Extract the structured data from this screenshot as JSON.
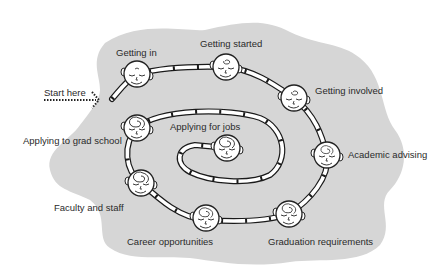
{
  "diagram": {
    "type": "spiral-path",
    "background_color": "#ffffff",
    "blob_color": "#d6d6d6",
    "track_color": "#ffffff",
    "track_outline": "#1a1a1a",
    "start": {
      "label": "Start here"
    },
    "stages": [
      {
        "id": "getting-in",
        "label": "Getting in",
        "head_style": "calm"
      },
      {
        "id": "getting-started",
        "label": "Getting started",
        "head_style": "slight-swirl"
      },
      {
        "id": "getting-involved",
        "label": "Getting involved",
        "head_style": "slight-swirl"
      },
      {
        "id": "academic-advising",
        "label": "Academic advising",
        "head_style": "swirl"
      },
      {
        "id": "graduation-requirements",
        "label": "Graduation requirements",
        "head_style": "swirl"
      },
      {
        "id": "career-opportunities",
        "label": "Career opportunities",
        "head_style": "swirl"
      },
      {
        "id": "faculty-and-staff",
        "label": "Faculty and staff",
        "head_style": "swirl"
      },
      {
        "id": "applying-to-grad-school",
        "label": "Applying to grad school",
        "head_style": "swirl"
      },
      {
        "id": "applying-for-jobs",
        "label": "Applying for jobs",
        "head_style": "swirl"
      }
    ]
  }
}
